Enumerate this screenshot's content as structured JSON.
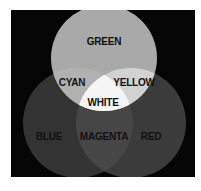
{
  "diagram": {
    "type": "venn",
    "background_color": "#050505",
    "page_color": "#ffffff",
    "frame": {
      "x": 11,
      "y": 10,
      "width": 184,
      "height": 167
    },
    "circles": [
      {
        "id": "green",
        "label": "GREEN",
        "cx": 104,
        "cy": 58,
        "r": 53,
        "fill": "#a9a9a9"
      },
      {
        "id": "blue",
        "label": "BLUE",
        "cx": 78,
        "cy": 123,
        "r": 55,
        "fill": "#333333"
      },
      {
        "id": "red",
        "label": "RED",
        "cx": 131,
        "cy": 123,
        "r": 55,
        "fill": "#3b3b3b"
      }
    ],
    "overlaps": {
      "cyan": {
        "label": "CYAN",
        "sets": [
          "green",
          "blue"
        ],
        "fill": "#b1b1b1"
      },
      "yellow": {
        "label": "YELLOW",
        "sets": [
          "green",
          "red"
        ],
        "fill": "#d2d2d2"
      },
      "magenta": {
        "label": "MAGENTA",
        "sets": [
          "blue",
          "red"
        ],
        "fill": "#464646"
      },
      "white": {
        "label": "WHITE",
        "sets": [
          "green",
          "blue",
          "red"
        ],
        "fill": "#f5f5f5"
      }
    },
    "labels": {
      "green": {
        "text": "GREEN",
        "x": 104,
        "y": 42
      },
      "cyan": {
        "text": "CYAN",
        "x": 72,
        "y": 83
      },
      "yellow": {
        "text": "YELLOW",
        "x": 134,
        "y": 83
      },
      "white": {
        "text": "WHITE",
        "x": 103,
        "y": 103
      },
      "blue": {
        "text": "BLUE",
        "x": 49,
        "y": 137
      },
      "magenta": {
        "text": "MAGENTA",
        "x": 104,
        "y": 137
      },
      "red": {
        "text": "RED",
        "x": 151,
        "y": 137
      }
    },
    "label_color": "#111111"
  }
}
